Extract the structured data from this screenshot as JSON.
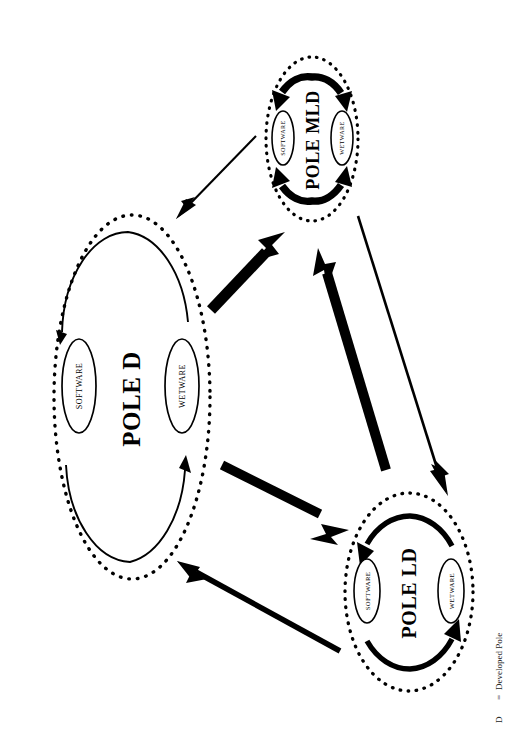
{
  "figure": {
    "background_color": "#ffffff",
    "ink_color": "#000000",
    "width": 516,
    "height": 756,
    "orientation": "rotated-90-landscape-on-portrait-page"
  },
  "legend": {
    "symbol": "D",
    "equals": "=",
    "meaning": "Developed Pole",
    "full_text": "D    = Developed Pole"
  },
  "nodes": [
    {
      "id": "pole-d",
      "label": "POLE D",
      "cycle_weight": "thin",
      "ring_style": "dotted",
      "center": {
        "x": 132,
        "y": 397
      },
      "radius": {
        "x": 78,
        "y": 182
      },
      "components": [
        {
          "id": "software",
          "label": "SOFTWARE"
        },
        {
          "id": "wetware",
          "label": "WETWARE"
        }
      ]
    },
    {
      "id": "pole-mld",
      "label": "POLE MLD",
      "cycle_weight": "very-thick",
      "ring_style": "dotted",
      "center": {
        "x": 312,
        "y": 139
      },
      "radius": {
        "x": 46,
        "y": 82
      },
      "components": [
        {
          "id": "software",
          "label": "SOFTWARE"
        },
        {
          "id": "wetware",
          "label": "WETWARE"
        }
      ]
    },
    {
      "id": "pole-ld",
      "label": "POLE LD",
      "cycle_weight": "thick",
      "ring_style": "dotted",
      "center": {
        "x": 409,
        "y": 592
      },
      "radius": {
        "x": 64,
        "y": 99
      },
      "components": [
        {
          "id": "software",
          "label": "SOFTWARE"
        },
        {
          "id": "wetware",
          "label": "WETWARE"
        }
      ]
    }
  ],
  "edges": [
    {
      "id": "mld-to-d",
      "from": "pole-mld",
      "to": "pole-d",
      "weight": "thin",
      "note": "POLE MLD influences POLE D"
    },
    {
      "id": "d-to-mld",
      "from": "pole-d",
      "to": "pole-mld",
      "weight": "very-thick",
      "note": "POLE D strongly influences POLE MLD"
    },
    {
      "id": "mld-to-ld",
      "from": "pole-mld",
      "to": "pole-ld",
      "weight": "thin",
      "note": "POLE MLD influences POLE LD"
    },
    {
      "id": "ld-to-mld",
      "from": "pole-ld",
      "to": "pole-mld",
      "weight": "very-thick",
      "note": "POLE LD strongly influences POLE MLD"
    },
    {
      "id": "d-to-ld",
      "from": "pole-d",
      "to": "pole-ld",
      "weight": "very-thick",
      "note": "POLE D strongly influences POLE LD"
    },
    {
      "id": "ld-to-d",
      "from": "pole-ld",
      "to": "pole-d",
      "weight": "thick",
      "note": "POLE LD influences POLE D"
    }
  ]
}
